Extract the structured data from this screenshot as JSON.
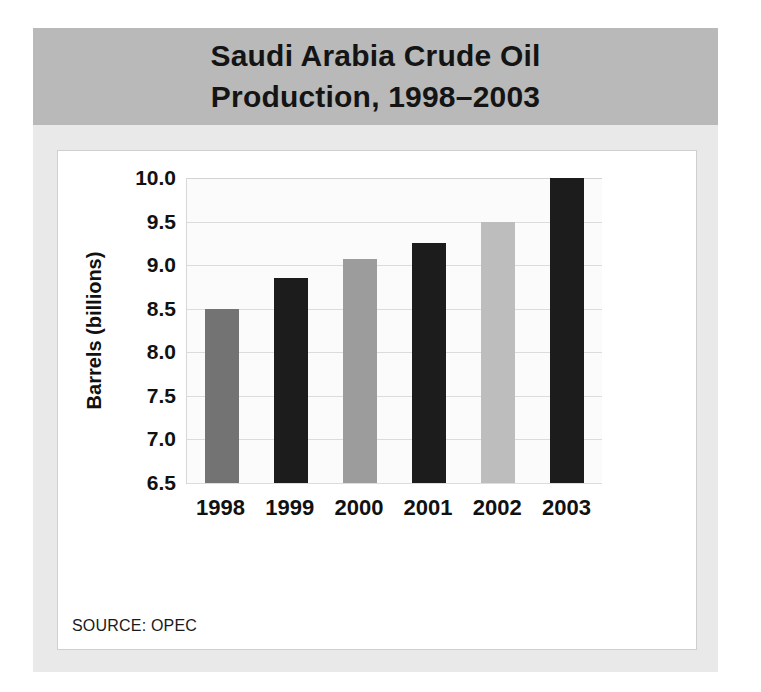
{
  "figure": {
    "title_line1": "Saudi Arabia Crude Oil",
    "title_line2": "Production, 1998–2003",
    "source_note": "SOURCE: OPEC"
  },
  "chart_data": {
    "type": "bar",
    "title": "Saudi Arabia Crude Oil Production, 1998–2003",
    "xlabel": "",
    "ylabel": "Barrels (billions)",
    "categories": [
      "1998",
      "1999",
      "2000",
      "2001",
      "2002",
      "2003"
    ],
    "values": [
      8.5,
      8.85,
      9.07,
      9.25,
      9.5,
      10.0
    ],
    "bar_colors": [
      "#737373",
      "#1c1c1c",
      "#9c9c9c",
      "#1c1c1c",
      "#bdbdbd",
      "#1c1c1c"
    ],
    "ylim": [
      6.5,
      10.0
    ],
    "ytick_values": [
      6.5,
      7.0,
      7.5,
      8.0,
      8.5,
      9.0,
      9.5,
      10.0
    ],
    "ytick_labels": [
      "6.5",
      "7.0",
      "7.5",
      "8.0",
      "8.5",
      "9.0",
      "9.5",
      "10.0"
    ],
    "grid": true,
    "legend": "none",
    "source": "OPEC"
  }
}
